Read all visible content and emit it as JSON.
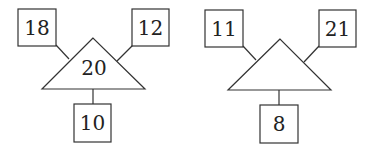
{
  "diagrams": [
    {
      "top_left": "18",
      "top_right": "12",
      "center": "20",
      "bottom": "10"
    },
    {
      "top_left": "11",
      "top_right": "21",
      "center": "",
      "bottom": "8"
    }
  ],
  "colors": {
    "stroke": "#333333",
    "background": "#ffffff",
    "text": "#222222"
  }
}
